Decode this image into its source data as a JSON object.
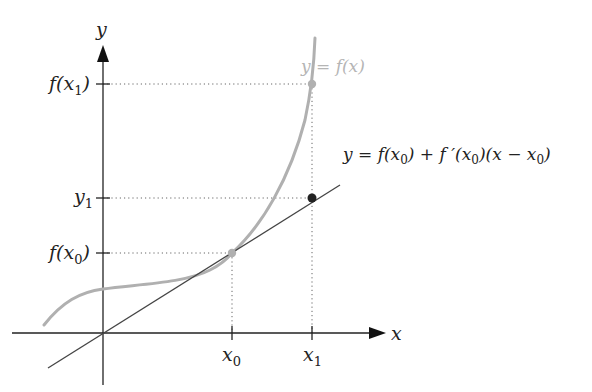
{
  "diagram": {
    "axes": {
      "x_label": "x",
      "y_label": "y"
    },
    "x_ticks": [
      {
        "id": "x0",
        "base": "x",
        "sub": "0"
      },
      {
        "id": "x1",
        "base": "x",
        "sub": "1"
      }
    ],
    "y_ticks": [
      {
        "id": "fx1",
        "prefix": "f(x",
        "sub": "1",
        "suffix": ")"
      },
      {
        "id": "y1",
        "base": "y",
        "sub": "1"
      },
      {
        "id": "fx0",
        "prefix": "f(x",
        "sub": "0",
        "suffix": ")"
      }
    ],
    "curve_label": "y = f(x)",
    "tangent_label": {
      "part1": "y = f(x",
      "sub1": "0",
      "part2": ") + f ′(x",
      "sub2": "0",
      "part3": ")(x − x",
      "sub3": "0",
      "part4": ")"
    },
    "points": [
      {
        "name": "point-on-curve-x0",
        "color": "#b0b0b0"
      },
      {
        "name": "point-on-curve-x1",
        "color": "#b0b0b0"
      },
      {
        "name": "point-on-tangent-x1",
        "color": "#222222"
      }
    ],
    "colors": {
      "axis": "#222222",
      "curve": "#b0b0b0",
      "tangent": "#444444",
      "guide": "#666666",
      "curve_label": "#b5b5b5"
    }
  }
}
